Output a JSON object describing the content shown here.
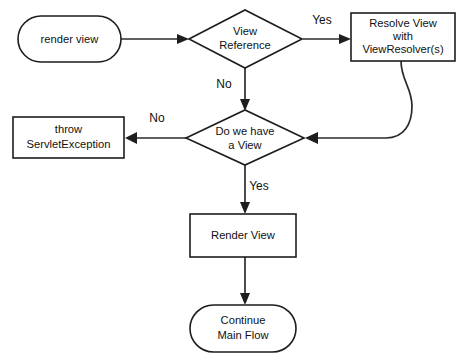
{
  "diagram": {
    "background_color": "#ffffff",
    "line_color": "#2b2b2b",
    "text_color": "#111111",
    "nodes": {
      "start": {
        "shape": "stadium",
        "label": "render view"
      },
      "view_reference": {
        "shape": "diamond",
        "label_line1": "View",
        "label_line2": "Reference"
      },
      "resolve_view": {
        "shape": "rectangle",
        "label_line1": "Resolve View",
        "label_line2": "with",
        "label_line3": "ViewResolver(s)"
      },
      "throw_exception": {
        "shape": "rectangle",
        "label_line1": "throw",
        "label_line2": "ServletException"
      },
      "have_view": {
        "shape": "diamond",
        "label_line1": "Do we have",
        "label_line2": "a View"
      },
      "render_view": {
        "shape": "rectangle",
        "label": "Render View"
      },
      "continue_flow": {
        "shape": "stadium",
        "label_line1": "Continue",
        "label_line2": "Main Flow"
      }
    },
    "edge_labels": {
      "view_reference_yes": "Yes",
      "view_reference_no": "No",
      "have_view_no": "No",
      "have_view_yes": "Yes"
    }
  }
}
